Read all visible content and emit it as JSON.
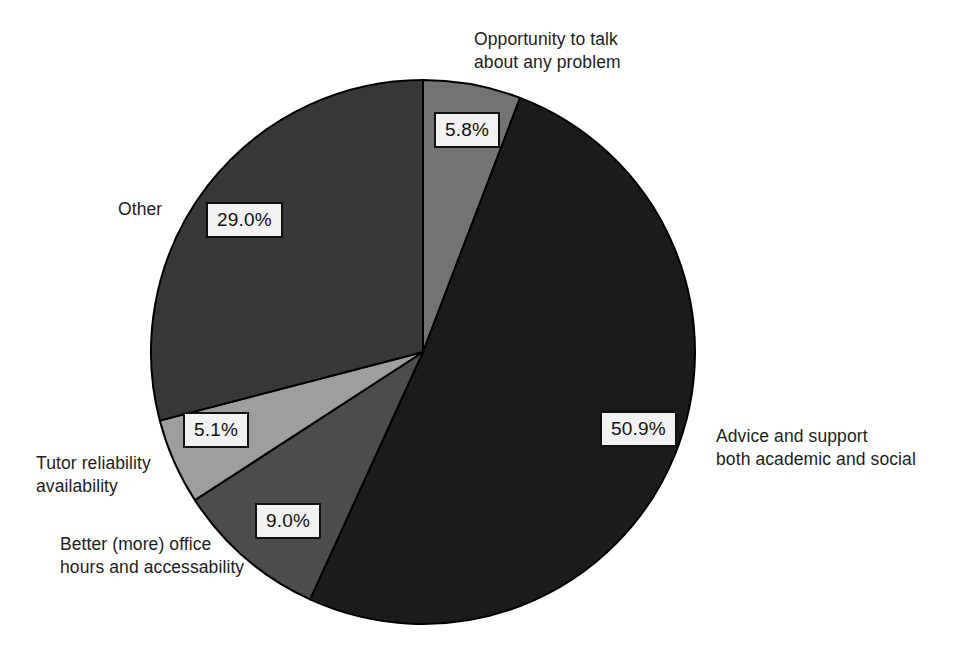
{
  "chart_data": {
    "type": "pie",
    "title": "",
    "subtitle": "",
    "xlabel": "",
    "ylabel": "",
    "legend_position": "none",
    "grid": false,
    "value_format": "percent",
    "start_angle_deg": 0,
    "direction": "clockwise",
    "categories": [
      "Opportunity to talk about any problem",
      "Advice and support both academic and social",
      "Better (more) office hours and accessability",
      "Tutor reliability availability",
      "Other"
    ],
    "values": [
      5.8,
      50.9,
      9.0,
      5.1,
      29.0
    ],
    "slices": [
      {
        "label": "Opportunity to talk\nabout any problem",
        "value": 5.8,
        "value_label": "5.8%",
        "color": "#737373"
      },
      {
        "label": "Advice and support\nboth academic and social",
        "value": 50.9,
        "value_label": "50.9%",
        "color": "#1b1b1b"
      },
      {
        "label": "Better (more) office\nhours and accessability",
        "value": 9.0,
        "value_label": "9.0%",
        "color": "#4c4c4c"
      },
      {
        "label": "Tutor reliability\navailability",
        "value": 5.1,
        "value_label": "5.1%",
        "color": "#9e9e9e"
      },
      {
        "label": "Other",
        "value": 29.0,
        "value_label": "29.0%",
        "color": "#383838"
      }
    ]
  },
  "figure": {
    "background_color": "#ffffff",
    "outline_color": "#000000",
    "callout_background": "#f2f2f2",
    "callout_border_color": "#101010",
    "center_x": 423,
    "center_y": 352,
    "radius": 272
  }
}
